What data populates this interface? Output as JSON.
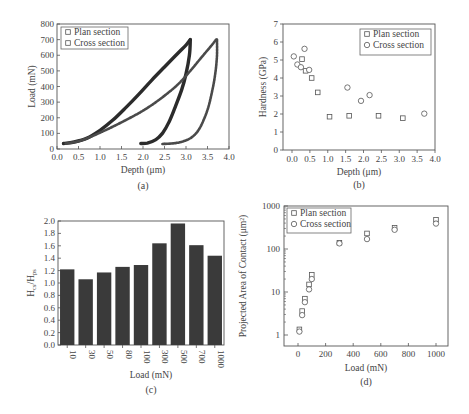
{
  "chart_data": [
    {
      "id": "a",
      "type": "line",
      "caption": "(a)",
      "xlabel": "Depth (μm)",
      "ylabel": "Load (mN)",
      "xlim": [
        0,
        4.0
      ],
      "ylim": [
        0,
        800
      ],
      "xticks": [
        "0.0",
        "0.5",
        "1.0",
        "1.5",
        "2.0",
        "2.5",
        "3.0",
        "3.5",
        "4.0"
      ],
      "yticks": [
        "0",
        "100",
        "200",
        "300",
        "400",
        "500",
        "600",
        "700",
        "800"
      ],
      "legend": {
        "position": "upper-left",
        "entries": [
          "Plan section",
          "Cross section"
        ]
      },
      "series": [
        {
          "name": "Plan section",
          "loading": [
            [
              0.15,
              35
            ],
            [
              0.4,
              45
            ],
            [
              0.7,
              70
            ],
            [
              1.0,
              120
            ],
            [
              1.3,
              185
            ],
            [
              1.6,
              265
            ],
            [
              1.9,
              350
            ],
            [
              2.2,
              440
            ],
            [
              2.5,
              525
            ],
            [
              2.8,
              610
            ],
            [
              3.0,
              665
            ],
            [
              3.1,
              700
            ]
          ],
          "unloading": [
            [
              3.1,
              700
            ],
            [
              3.08,
              600
            ],
            [
              3.0,
              480
            ],
            [
              2.9,
              380
            ],
            [
              2.75,
              270
            ],
            [
              2.6,
              170
            ],
            [
              2.45,
              100
            ],
            [
              2.3,
              60
            ],
            [
              2.1,
              38
            ],
            [
              1.95,
              35
            ]
          ]
        },
        {
          "name": "Cross section",
          "loading": [
            [
              0.2,
              35
            ],
            [
              0.5,
              50
            ],
            [
              0.8,
              80
            ],
            [
              1.2,
              130
            ],
            [
              1.6,
              185
            ],
            [
              2.0,
              245
            ],
            [
              2.4,
              320
            ],
            [
              2.8,
              410
            ],
            [
              3.1,
              500
            ],
            [
              3.4,
              600
            ],
            [
              3.6,
              665
            ],
            [
              3.7,
              700
            ]
          ],
          "unloading": [
            [
              3.72,
              700
            ],
            [
              3.72,
              600
            ],
            [
              3.68,
              480
            ],
            [
              3.6,
              360
            ],
            [
              3.5,
              250
            ],
            [
              3.35,
              150
            ],
            [
              3.2,
              90
            ],
            [
              3.0,
              55
            ],
            [
              2.75,
              38
            ],
            [
              2.45,
              32
            ]
          ]
        }
      ]
    },
    {
      "id": "b",
      "type": "scatter",
      "caption": "(b)",
      "xlabel": "Depth (μm)",
      "ylabel": "Hardness (GPa)",
      "xlim": [
        0,
        4.0
      ],
      "ylim": [
        0,
        7
      ],
      "xticks": [
        "0.0",
        "0.5",
        "1.0",
        "1.5",
        "2.0",
        "2.5",
        "3.0",
        "3.5",
        "4.0"
      ],
      "yticks": [
        "0",
        "1",
        "2",
        "3",
        "4",
        "5",
        "6",
        "7"
      ],
      "legend": {
        "position": "upper-right",
        "entries": [
          "Plan section",
          "Cross section"
        ]
      },
      "series": [
        {
          "name": "Plan section",
          "marker": "square",
          "points": [
            [
              0.28,
              5.05
            ],
            [
              0.38,
              4.4
            ],
            [
              0.55,
              4.0
            ],
            [
              0.72,
              3.2
            ],
            [
              1.05,
              1.85
            ],
            [
              1.6,
              1.9
            ],
            [
              2.42,
              1.9
            ],
            [
              3.1,
              1.77
            ]
          ]
        },
        {
          "name": "Cross section",
          "marker": "circle",
          "points": [
            [
              0.05,
              5.2
            ],
            [
              0.15,
              4.75
            ],
            [
              0.25,
              4.6
            ],
            [
              0.35,
              5.62
            ],
            [
              0.48,
              4.45
            ],
            [
              1.55,
              3.47
            ],
            [
              1.93,
              2.73
            ],
            [
              2.17,
              3.05
            ],
            [
              3.7,
              2.02
            ]
          ]
        }
      ]
    },
    {
      "id": "c",
      "type": "bar",
      "caption": "(c)",
      "xlabel": "Load (mN)",
      "ylabel": "H_cs/H_ps",
      "ylabel_main": "H",
      "ylabel_sub1": "cs",
      "ylabel_sub2": "ps",
      "ylim": [
        0,
        2.0
      ],
      "yticks": [
        "0.0",
        "0.2",
        "0.4",
        "0.6",
        "0.8",
        "1.0",
        "1.2",
        "1.4",
        "1.6",
        "1.8",
        "2.0"
      ],
      "categories": [
        "10",
        "30",
        "50",
        "80",
        "100",
        "300",
        "500",
        "700",
        "1000"
      ],
      "values": [
        1.22,
        1.06,
        1.17,
        1.26,
        1.29,
        1.64,
        1.96,
        1.61,
        1.44
      ],
      "bar_color": "#3a3a3a"
    },
    {
      "id": "d",
      "type": "scatter",
      "caption": "(d)",
      "xlabel": "Load (mN)",
      "ylabel": "Projected Area of Contact (μm²)",
      "yscale": "log",
      "xlim": [
        -100,
        1080
      ],
      "ylim": [
        0.55,
        1000
      ],
      "xticks": [
        "0",
        "200",
        "400",
        "600",
        "800",
        "1000"
      ],
      "yticks": [
        "1",
        "10",
        "100",
        "1000"
      ],
      "legend": {
        "position": "upper-left",
        "entries": [
          "Plan section",
          "Cross section"
        ]
      },
      "series": [
        {
          "name": "Plan section",
          "marker": "square",
          "points": [
            [
              10,
              1.35
            ],
            [
              30,
              3.6
            ],
            [
              50,
              7.0
            ],
            [
              80,
              15
            ],
            [
              100,
              25
            ],
            [
              300,
              140
            ],
            [
              500,
              230
            ],
            [
              700,
              310
            ],
            [
              1000,
              480
            ]
          ]
        },
        {
          "name": "Cross section",
          "marker": "circle",
          "points": [
            [
              10,
              1.2
            ],
            [
              30,
              2.9
            ],
            [
              50,
              5.8
            ],
            [
              80,
              11.5
            ],
            [
              100,
              20
            ],
            [
              300,
              135
            ],
            [
              500,
              170
            ],
            [
              700,
              280
            ],
            [
              1000,
              390
            ]
          ]
        }
      ]
    }
  ]
}
